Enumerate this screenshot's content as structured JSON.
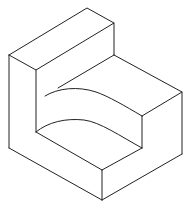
{
  "diagram": {
    "title": "",
    "stroke_color": "#222222",
    "background": "#ffffff"
  }
}
